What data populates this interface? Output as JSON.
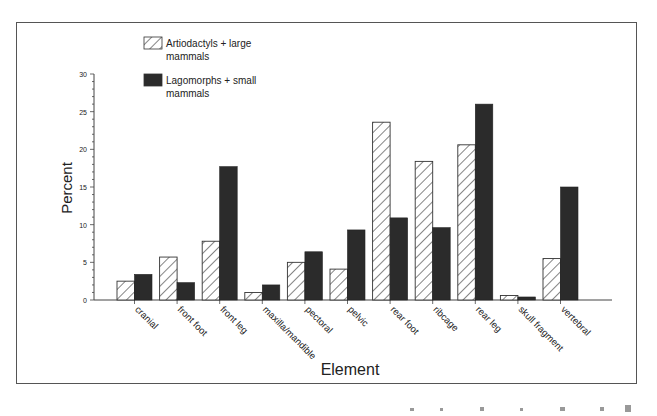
{
  "chart_data": {
    "type": "bar",
    "title": "",
    "xlabel": "Element",
    "ylabel": "Percent",
    "ylim": [
      0,
      30
    ],
    "yticks": [
      0,
      5,
      10,
      15,
      20,
      25,
      30
    ],
    "grid": false,
    "legend_position": "top-left inside plot",
    "categories": [
      "cranial",
      "front foot",
      "front leg",
      "maxilla/mandible",
      "pectoral",
      "pelvic",
      "rear foot",
      "ribcage",
      "rear leg",
      "skull fragment",
      "vertebral"
    ],
    "series": [
      {
        "name": "Artiodactyls + large mammals",
        "pattern": "hatched",
        "values": [
          2.5,
          5.7,
          7.8,
          1.0,
          5.0,
          4.1,
          23.6,
          18.4,
          20.6,
          0.6,
          5.5
        ]
      },
      {
        "name": "Lagomorphs + small mammals",
        "pattern": "solid",
        "values": [
          3.4,
          2.3,
          17.7,
          2.0,
          6.4,
          9.3,
          10.9,
          9.6,
          26.0,
          0.4,
          15.0
        ]
      }
    ]
  },
  "legend": {
    "items": [
      {
        "line1": "Artiodactyls + large",
        "line2": "mammals"
      },
      {
        "line1": "Lagomorphs + small",
        "line2": "mammals"
      }
    ]
  },
  "colors": {
    "solid_bar": "#2b2b2b",
    "hatch": "#333333",
    "frame": "#555555",
    "axis": "#444444"
  }
}
